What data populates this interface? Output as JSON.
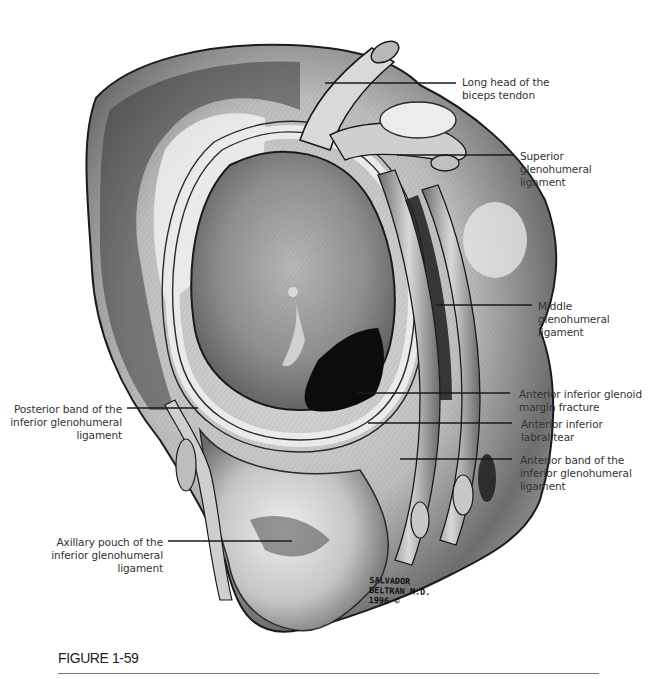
{
  "figure": {
    "caption": "FIGURE 1-59",
    "signature": [
      "SALVADOR",
      "BELTRAN M.D.",
      "1996 ©"
    ]
  },
  "labels": {
    "long_head_biceps": [
      "Long head of the",
      "biceps tendon"
    ],
    "superior_gh": [
      "Superior",
      "glenohumeral",
      "ligament"
    ],
    "middle_gh": [
      "Middle",
      "glenohumeral",
      "ligament"
    ],
    "ant_inf_fracture": [
      "Anterior inferior glenoid",
      "margin fracture"
    ],
    "ant_inf_labral_tear": [
      "Anterior inferior",
      "labral tear"
    ],
    "ant_band_ighl": [
      "Anterior band of the",
      "inferior glenohumeral",
      "ligament"
    ],
    "post_band_ighl": [
      "Posterior band of the",
      "inferior glenohumeral",
      "ligament"
    ],
    "axillary_pouch": [
      "Axillary pouch of the",
      "inferior glenohumeral",
      "ligament"
    ]
  },
  "colors": {
    "ink": "#1a1a1a",
    "shade_dark": "#4a4a4a",
    "shade_mid": "#8a8a8a",
    "shade_light": "#d2d2d2",
    "paper": "#ffffff"
  }
}
